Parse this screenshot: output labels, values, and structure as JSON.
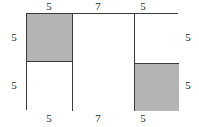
{
  "figure": {
    "kind": "geometry-diagram",
    "colors": {
      "stroke": "#3b3b3b",
      "shaded_fill": "#b4b4b4",
      "unshaded_fill": "#ffffff",
      "label_text": "#2b2b2b",
      "background": "#ffffff"
    },
    "outer_rectangle": {
      "width_label": "17",
      "height_label": "10"
    },
    "cells": [
      {
        "id": "top-left",
        "shaded": true,
        "width_label": "5",
        "height_label": "5"
      },
      {
        "id": "bottom-left",
        "shaded": false,
        "width_label": "5",
        "height_label": "5"
      },
      {
        "id": "middle",
        "shaded": false,
        "width_label": "7",
        "height_label": "10"
      },
      {
        "id": "top-right",
        "shaded": false,
        "width_label": "5",
        "height_label": "5"
      },
      {
        "id": "bottom-right",
        "shaded": true,
        "width_label": "5",
        "height_label": "5"
      }
    ],
    "labels": {
      "top": [
        "5",
        "7",
        "5"
      ],
      "bottom": [
        "5",
        "7",
        "5"
      ],
      "left": [
        "5",
        "5"
      ],
      "right": [
        "5",
        "5"
      ]
    }
  },
  "chart_data": {
    "type": "table",
    "title": "",
    "categories": [
      "top-left",
      "bottom-left",
      "middle",
      "top-right",
      "bottom-right"
    ],
    "series": [
      {
        "name": "width",
        "values": [
          5,
          5,
          7,
          5,
          5
        ]
      },
      {
        "name": "height",
        "values": [
          5,
          5,
          10,
          5,
          5
        ]
      }
    ],
    "annotations": {
      "top_edge_segments": [
        5,
        7,
        5
      ],
      "bottom_edge_segments": [
        5,
        7,
        5
      ],
      "left_edge_segments": [
        5,
        5
      ],
      "right_edge_segments": [
        5,
        5
      ],
      "shaded_cells": [
        "top-left",
        "bottom-right"
      ]
    }
  }
}
